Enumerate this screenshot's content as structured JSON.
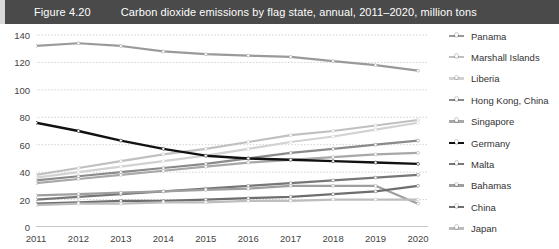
{
  "figure": {
    "number": "Figure 4.20",
    "title": "Carbon dioxide emissions by flag state, annual, 2011–2020, million tons",
    "titlebar_color": "#4a4a4a",
    "titlebar_text_color": "#ffffff",
    "background": "#ffffff"
  },
  "chart_data": {
    "type": "line",
    "title": "Carbon dioxide emissions by flag state, annual, 2011–2020, million tons",
    "xlabel": "",
    "ylabel": "",
    "x": [
      2011,
      2012,
      2013,
      2014,
      2015,
      2016,
      2017,
      2018,
      2019,
      2020
    ],
    "categories": [
      "2011",
      "2012",
      "2013",
      "2014",
      "2015",
      "2016",
      "2017",
      "2018",
      "2019",
      "2020"
    ],
    "ylim": [
      0,
      140
    ],
    "yticks": [
      0,
      20,
      40,
      60,
      80,
      100,
      120,
      140
    ],
    "ytick_labels": [
      "0",
      "20",
      "40",
      "60",
      "80",
      "100",
      "120",
      "140"
    ],
    "grid": true,
    "grid_style": "dotted-horizontal",
    "legend_position": "right",
    "markers": "small white circles",
    "series": [
      {
        "name": "Panama",
        "color": "#9a9a9a",
        "width": 2.2,
        "values": [
          132,
          134,
          132,
          128,
          126,
          125,
          124,
          121,
          118,
          114
        ]
      },
      {
        "name": "Marshall Islands",
        "color": "#c0c0c0",
        "width": 2.2,
        "values": [
          38,
          43,
          48,
          53,
          57,
          62,
          67,
          70,
          74,
          78
        ]
      },
      {
        "name": "Liberia",
        "color": "#d2d2d2",
        "width": 2.2,
        "values": [
          36,
          40,
          44,
          48,
          52,
          57,
          62,
          66,
          71,
          76
        ]
      },
      {
        "name": "Hong Kong, China",
        "color": "#8a8a8a",
        "width": 2.2,
        "values": [
          34,
          37,
          40,
          43,
          46,
          50,
          54,
          57,
          60,
          63
        ]
      },
      {
        "name": "Singapore",
        "color": "#a8a8a8",
        "width": 2.2,
        "values": [
          32,
          35,
          38,
          41,
          44,
          47,
          49,
          51,
          53,
          54
        ]
      },
      {
        "name": "Germany",
        "color": "#111111",
        "width": 2.4,
        "values": [
          76,
          70,
          63,
          57,
          52,
          50,
          49,
          48,
          47,
          46
        ]
      },
      {
        "name": "Malta",
        "color": "#777777",
        "width": 2.2,
        "values": [
          20,
          22,
          24,
          26,
          28,
          30,
          32,
          34,
          36,
          38
        ]
      },
      {
        "name": "Bahamas",
        "color": "#9f9f9f",
        "width": 2.2,
        "values": [
          23,
          24,
          25,
          26,
          27,
          28,
          30,
          30,
          30,
          17
        ]
      },
      {
        "name": "China",
        "color": "#6e6e6e",
        "width": 2.2,
        "values": [
          17,
          18,
          19,
          19,
          20,
          21,
          22,
          24,
          26,
          30
        ]
      },
      {
        "name": "Japan",
        "color": "#bdbdbd",
        "width": 2.2,
        "values": [
          16,
          17,
          17,
          18,
          18,
          19,
          19,
          20,
          20,
          20
        ]
      }
    ]
  },
  "legend": {
    "items": [
      {
        "label": "Panama",
        "color": "#9a9a9a"
      },
      {
        "label": "Marshall Islands",
        "color": "#c0c0c0"
      },
      {
        "label": "Liberia",
        "color": "#d2d2d2"
      },
      {
        "label": "Hong Kong, China",
        "color": "#8a8a8a"
      },
      {
        "label": "Singapore",
        "color": "#a8a8a8"
      },
      {
        "label": "Germany",
        "color": "#111111"
      },
      {
        "label": "Malta",
        "color": "#777777"
      },
      {
        "label": "Bahamas",
        "color": "#9f9f9f"
      },
      {
        "label": "China",
        "color": "#6e6e6e"
      },
      {
        "label": "Japan",
        "color": "#bdbdbd"
      }
    ]
  }
}
